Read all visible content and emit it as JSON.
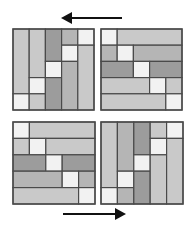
{
  "colors": {
    "background": "#ffffff",
    "border": "#4a4a4a",
    "white": "#f2f2f2",
    "light": "#c9c9c9",
    "mid": "#b5b5b5",
    "dark": "#9c9c9c",
    "arrow": "#111111"
  },
  "arrows": [
    {
      "name": "arrow-left-icon",
      "x1": 122,
      "y1": 18,
      "x2": 61,
      "y2": 18,
      "direction": "left"
    },
    {
      "name": "arrow-right-icon",
      "x1": 63,
      "y1": 214,
      "x2": 126,
      "y2": 214,
      "direction": "right"
    }
  ],
  "panels": [
    {
      "name": "panel-top-left",
      "x": 13,
      "y": 29,
      "size": 81,
      "cells": [
        {
          "c": 0,
          "r": 0,
          "w": 1,
          "h": 4,
          "shade": "light"
        },
        {
          "c": 0,
          "r": 4,
          "w": 1,
          "h": 1,
          "shade": "white"
        },
        {
          "c": 1,
          "r": 0,
          "w": 1,
          "h": 3,
          "shade": "light"
        },
        {
          "c": 1,
          "r": 3,
          "w": 1,
          "h": 1,
          "shade": "white"
        },
        {
          "c": 1,
          "r": 4,
          "w": 1,
          "h": 1,
          "shade": "light"
        },
        {
          "c": 2,
          "r": 0,
          "w": 1,
          "h": 2,
          "shade": "dark"
        },
        {
          "c": 2,
          "r": 2,
          "w": 1,
          "h": 1,
          "shade": "white"
        },
        {
          "c": 2,
          "r": 3,
          "w": 1,
          "h": 2,
          "shade": "dark"
        },
        {
          "c": 3,
          "r": 0,
          "w": 1,
          "h": 1,
          "shade": "mid"
        },
        {
          "c": 3,
          "r": 1,
          "w": 1,
          "h": 1,
          "shade": "white"
        },
        {
          "c": 3,
          "r": 2,
          "w": 1,
          "h": 3,
          "shade": "mid"
        },
        {
          "c": 4,
          "r": 0,
          "w": 1,
          "h": 1,
          "shade": "white"
        },
        {
          "c": 4,
          "r": 1,
          "w": 1,
          "h": 4,
          "shade": "light"
        }
      ]
    },
    {
      "name": "panel-top-right",
      "x": 101,
      "y": 29,
      "size": 81,
      "cells": [
        {
          "c": 0,
          "r": 0,
          "w": 1,
          "h": 1,
          "shade": "white"
        },
        {
          "c": 1,
          "r": 0,
          "w": 4,
          "h": 1,
          "shade": "light"
        },
        {
          "c": 0,
          "r": 1,
          "w": 1,
          "h": 1,
          "shade": "mid"
        },
        {
          "c": 1,
          "r": 1,
          "w": 1,
          "h": 1,
          "shade": "white"
        },
        {
          "c": 2,
          "r": 1,
          "w": 3,
          "h": 1,
          "shade": "mid"
        },
        {
          "c": 0,
          "r": 2,
          "w": 2,
          "h": 1,
          "shade": "dark"
        },
        {
          "c": 2,
          "r": 2,
          "w": 1,
          "h": 1,
          "shade": "white"
        },
        {
          "c": 3,
          "r": 2,
          "w": 2,
          "h": 1,
          "shade": "dark"
        },
        {
          "c": 0,
          "r": 3,
          "w": 3,
          "h": 1,
          "shade": "light"
        },
        {
          "c": 3,
          "r": 3,
          "w": 1,
          "h": 1,
          "shade": "white"
        },
        {
          "c": 4,
          "r": 3,
          "w": 1,
          "h": 1,
          "shade": "light"
        },
        {
          "c": 0,
          "r": 4,
          "w": 4,
          "h": 1,
          "shade": "light"
        },
        {
          "c": 4,
          "r": 4,
          "w": 1,
          "h": 1,
          "shade": "white"
        }
      ]
    },
    {
      "name": "panel-bottom-left",
      "x": 13,
      "y": 122,
      "size": 82,
      "cells": [
        {
          "c": 0,
          "r": 0,
          "w": 1,
          "h": 1,
          "shade": "white"
        },
        {
          "c": 1,
          "r": 0,
          "w": 4,
          "h": 1,
          "shade": "light"
        },
        {
          "c": 0,
          "r": 1,
          "w": 1,
          "h": 1,
          "shade": "light"
        },
        {
          "c": 1,
          "r": 1,
          "w": 1,
          "h": 1,
          "shade": "white"
        },
        {
          "c": 2,
          "r": 1,
          "w": 3,
          "h": 1,
          "shade": "light"
        },
        {
          "c": 0,
          "r": 2,
          "w": 2,
          "h": 1,
          "shade": "dark"
        },
        {
          "c": 2,
          "r": 2,
          "w": 1,
          "h": 1,
          "shade": "white"
        },
        {
          "c": 3,
          "r": 2,
          "w": 2,
          "h": 1,
          "shade": "dark"
        },
        {
          "c": 0,
          "r": 3,
          "w": 3,
          "h": 1,
          "shade": "mid"
        },
        {
          "c": 3,
          "r": 3,
          "w": 1,
          "h": 1,
          "shade": "white"
        },
        {
          "c": 4,
          "r": 3,
          "w": 1,
          "h": 1,
          "shade": "mid"
        },
        {
          "c": 0,
          "r": 4,
          "w": 4,
          "h": 1,
          "shade": "light"
        },
        {
          "c": 4,
          "r": 4,
          "w": 1,
          "h": 1,
          "shade": "white"
        }
      ]
    },
    {
      "name": "panel-bottom-right",
      "x": 101,
      "y": 122,
      "size": 82,
      "cells": [
        {
          "c": 0,
          "r": 0,
          "w": 1,
          "h": 4,
          "shade": "light"
        },
        {
          "c": 0,
          "r": 4,
          "w": 1,
          "h": 1,
          "shade": "white"
        },
        {
          "c": 1,
          "r": 0,
          "w": 1,
          "h": 3,
          "shade": "mid"
        },
        {
          "c": 1,
          "r": 3,
          "w": 1,
          "h": 1,
          "shade": "white"
        },
        {
          "c": 1,
          "r": 4,
          "w": 1,
          "h": 1,
          "shade": "mid"
        },
        {
          "c": 2,
          "r": 0,
          "w": 1,
          "h": 2,
          "shade": "dark"
        },
        {
          "c": 2,
          "r": 2,
          "w": 1,
          "h": 1,
          "shade": "white"
        },
        {
          "c": 2,
          "r": 3,
          "w": 1,
          "h": 2,
          "shade": "dark"
        },
        {
          "c": 3,
          "r": 0,
          "w": 1,
          "h": 1,
          "shade": "light"
        },
        {
          "c": 3,
          "r": 1,
          "w": 1,
          "h": 1,
          "shade": "white"
        },
        {
          "c": 3,
          "r": 2,
          "w": 1,
          "h": 3,
          "shade": "light"
        },
        {
          "c": 4,
          "r": 0,
          "w": 1,
          "h": 1,
          "shade": "white"
        },
        {
          "c": 4,
          "r": 1,
          "w": 1,
          "h": 4,
          "shade": "light"
        }
      ]
    }
  ]
}
